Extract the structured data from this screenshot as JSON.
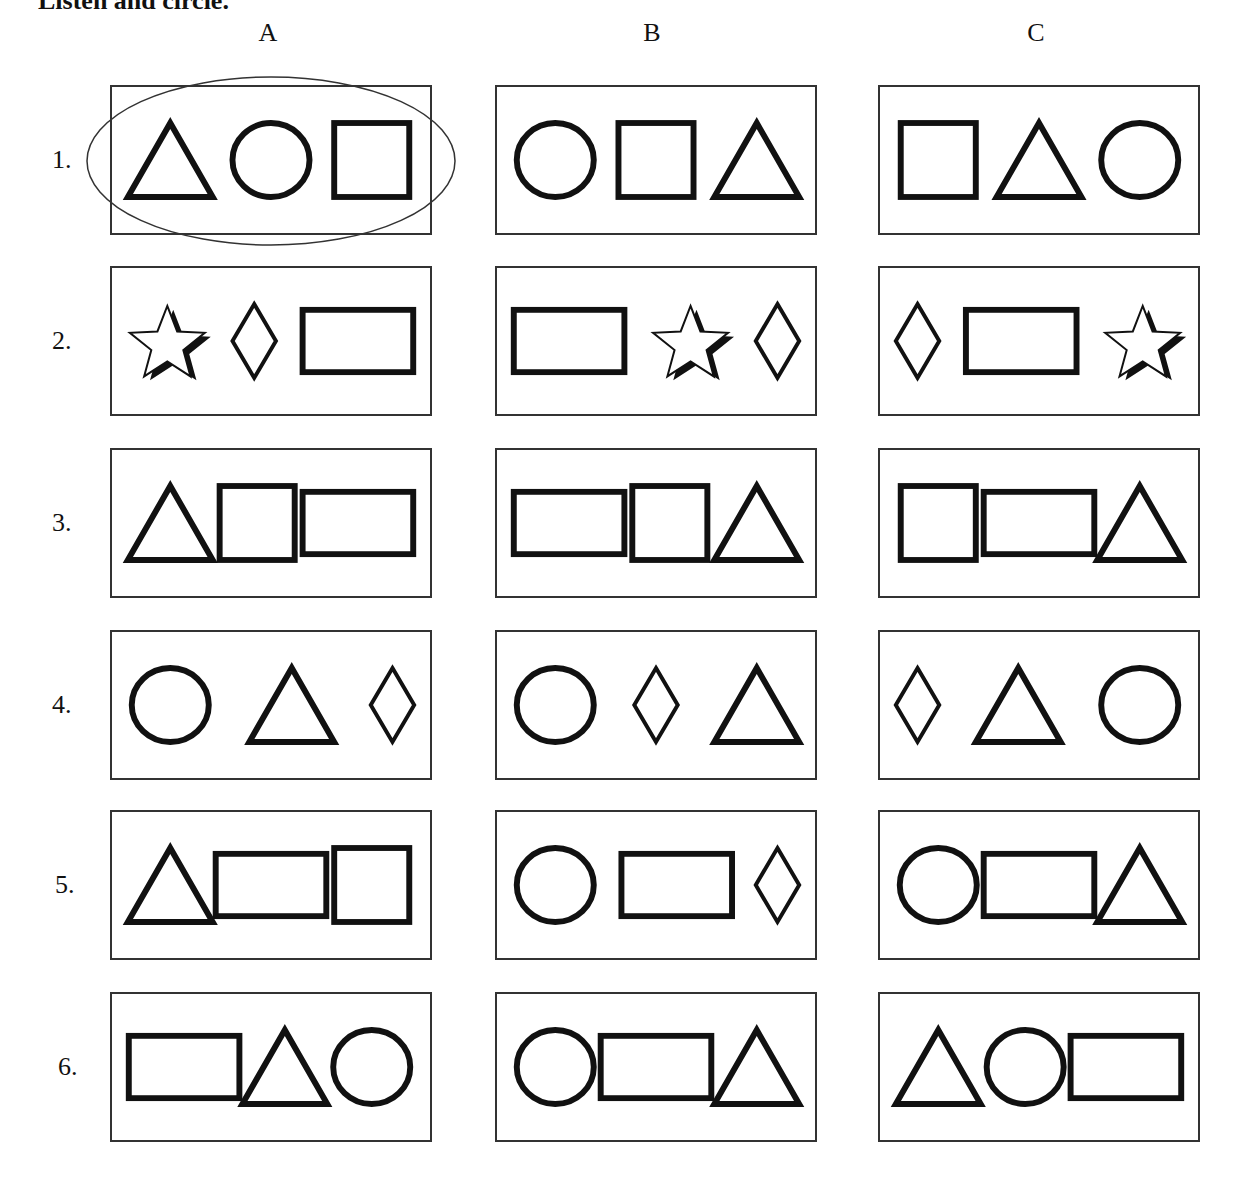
{
  "instruction": "Listen and circle.",
  "columns": [
    "A",
    "B",
    "C"
  ],
  "rows": [
    {
      "number": "1.",
      "options": [
        {
          "column": "A",
          "shapes": [
            "triangle",
            "circle",
            "square"
          ],
          "circled": true
        },
        {
          "column": "B",
          "shapes": [
            "circle",
            "square",
            "triangle"
          ],
          "circled": false
        },
        {
          "column": "C",
          "shapes": [
            "square",
            "triangle",
            "circle"
          ],
          "circled": false
        }
      ]
    },
    {
      "number": "2.",
      "options": [
        {
          "column": "A",
          "shapes": [
            "star",
            "diamond",
            "rectangle"
          ],
          "circled": false
        },
        {
          "column": "B",
          "shapes": [
            "rectangle",
            "star",
            "diamond"
          ],
          "circled": false
        },
        {
          "column": "C",
          "shapes": [
            "diamond",
            "rectangle",
            "star"
          ],
          "circled": false
        }
      ]
    },
    {
      "number": "3.",
      "options": [
        {
          "column": "A",
          "shapes": [
            "triangle",
            "square",
            "rectangle"
          ],
          "circled": false
        },
        {
          "column": "B",
          "shapes": [
            "rectangle",
            "square",
            "triangle"
          ],
          "circled": false
        },
        {
          "column": "C",
          "shapes": [
            "square",
            "rectangle",
            "triangle"
          ],
          "circled": false
        }
      ]
    },
    {
      "number": "4.",
      "options": [
        {
          "column": "A",
          "shapes": [
            "circle",
            "triangle",
            "diamond"
          ],
          "circled": false
        },
        {
          "column": "B",
          "shapes": [
            "circle",
            "diamond",
            "triangle"
          ],
          "circled": false
        },
        {
          "column": "C",
          "shapes": [
            "diamond",
            "triangle",
            "circle"
          ],
          "circled": false
        }
      ]
    },
    {
      "number": "5.",
      "options": [
        {
          "column": "A",
          "shapes": [
            "triangle",
            "rectangle",
            "square"
          ],
          "circled": false
        },
        {
          "column": "B",
          "shapes": [
            "circle",
            "rectangle",
            "diamond"
          ],
          "circled": false
        },
        {
          "column": "C",
          "shapes": [
            "circle",
            "rectangle",
            "triangle"
          ],
          "circled": false
        }
      ]
    },
    {
      "number": "6.",
      "options": [
        {
          "column": "A",
          "shapes": [
            "rectangle",
            "triangle",
            "circle"
          ],
          "circled": false
        },
        {
          "column": "B",
          "shapes": [
            "circle",
            "rectangle",
            "triangle"
          ],
          "circled": false
        },
        {
          "column": "C",
          "shapes": [
            "triangle",
            "circle",
            "rectangle"
          ],
          "circled": false
        }
      ]
    }
  ]
}
